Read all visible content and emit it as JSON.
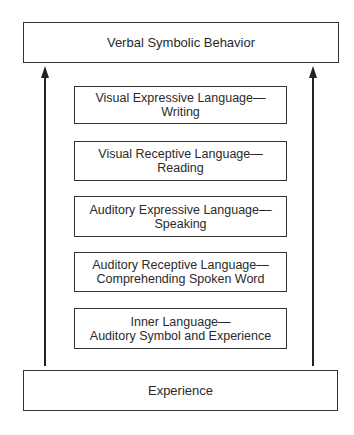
{
  "diagram": {
    "top_box": "Verbal Symbolic Behavior",
    "bottom_box": "Experience",
    "levels": [
      {
        "line1": "Visual Expressive Language—",
        "line2": "Writing"
      },
      {
        "line1": "Visual Receptive Language—",
        "line2": "Reading"
      },
      {
        "line1": "Auditory Expressive Language—",
        "line2": "Speaking"
      },
      {
        "line1": "Auditory Receptive Language—",
        "line2": "Comprehending Spoken Word"
      },
      {
        "line1": "Inner Language—",
        "line2": "Auditory Symbol and Experience"
      }
    ],
    "arrows": [
      {
        "side": "left",
        "direction": "up"
      },
      {
        "side": "right",
        "direction": "up"
      }
    ]
  }
}
